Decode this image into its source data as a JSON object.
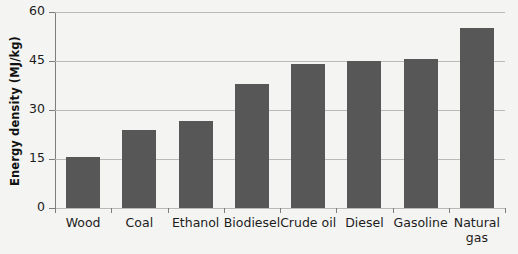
{
  "chart_data": {
    "type": "bar",
    "title": "",
    "subtitle": "",
    "xlabel": "",
    "ylabel": "Energy density (MJ/kg)",
    "categories": [
      "Wood",
      "Coal",
      "Ethanol",
      "Biodiesel",
      "Crude oil",
      "Diesel",
      "Gasoline",
      "Natural\ngas"
    ],
    "values": [
      15.5,
      24,
      26.7,
      38,
      44,
      45,
      45.5,
      55
    ],
    "ylim": [
      0,
      60
    ],
    "yticks": [
      0,
      15,
      30,
      45,
      60
    ],
    "ytick_labels": [
      "0",
      "15",
      "30",
      "45",
      "60"
    ],
    "grid": "horizontal",
    "legend": "none",
    "series": [
      {
        "name": "Energy density",
        "values": [
          15.5,
          24,
          26.7,
          38,
          44,
          45,
          45.5,
          55
        ]
      }
    ],
    "colors": {
      "bar": "#575757",
      "background": "#f4f4f2",
      "gridline": "#b9b9b7",
      "axis": "#7d7d7b",
      "text": "#1c1c1c"
    }
  }
}
